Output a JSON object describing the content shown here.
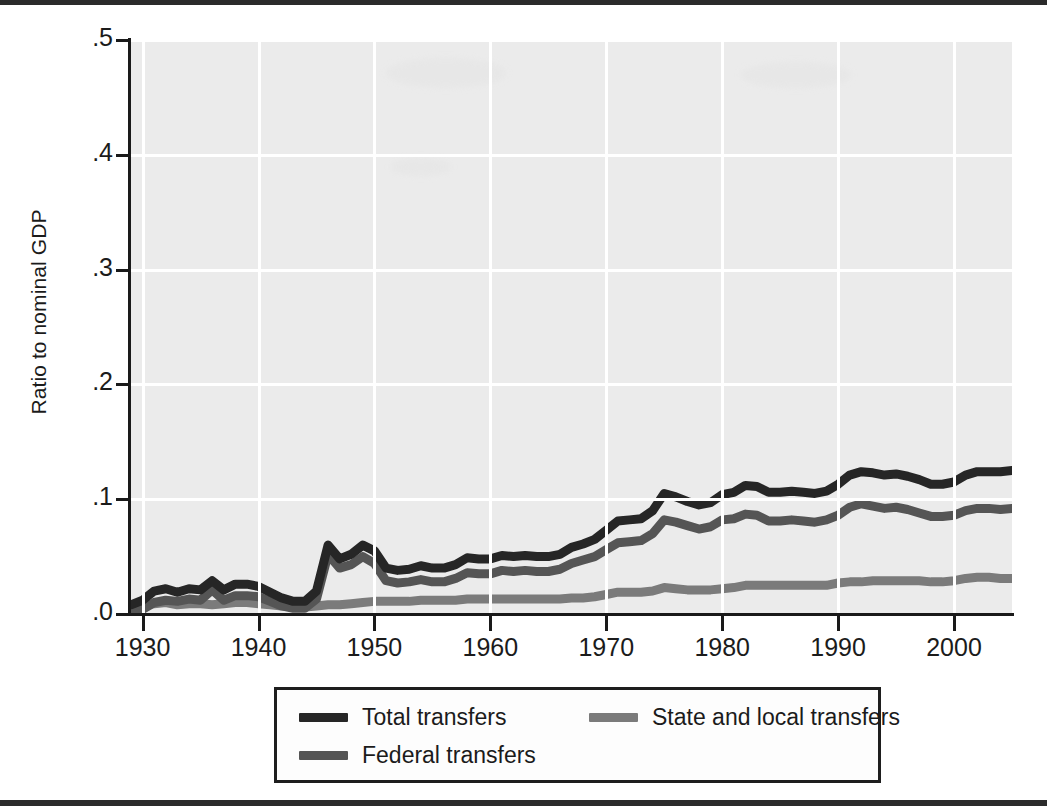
{
  "axes": {
    "ylabel": "Ratio to nominal GDP",
    "y_ticks": [
      ".0",
      ".1",
      ".2",
      ".3",
      ".4",
      ".5"
    ],
    "x_ticks": [
      "1930",
      "1940",
      "1950",
      "1960",
      "1970",
      "1980",
      "1990",
      "2000"
    ]
  },
  "legend": {
    "items": [
      {
        "label": "Total transfers",
        "color": "#262626"
      },
      {
        "label": "State and local transfers",
        "color": "#7b7b7b"
      },
      {
        "label": "Federal transfers",
        "color": "#555555"
      }
    ]
  },
  "colors": {
    "plot_background": "#ebebeb",
    "gridline": "#ffffff",
    "axis": "#1a1a1a",
    "total": "#262626",
    "federal": "#555555",
    "state_local": "#7b7b7b"
  },
  "chart_data": {
    "type": "line",
    "title": "",
    "xlabel": "",
    "ylabel": "Ratio to nominal GDP",
    "xlim": [
      1929,
      2005
    ],
    "ylim": [
      0.0,
      0.5
    ],
    "ytick_values": [
      0.0,
      0.1,
      0.2,
      0.3,
      0.4,
      0.5
    ],
    "xtick_values": [
      1930,
      1940,
      1950,
      1960,
      1970,
      1980,
      1990,
      2000
    ],
    "grid": true,
    "legend_position": "below-axes",
    "x": [
      1929,
      1930,
      1931,
      1932,
      1933,
      1934,
      1935,
      1936,
      1937,
      1938,
      1939,
      1940,
      1941,
      1942,
      1943,
      1944,
      1945,
      1946,
      1947,
      1948,
      1949,
      1950,
      1951,
      1952,
      1953,
      1954,
      1955,
      1956,
      1957,
      1958,
      1959,
      1960,
      1961,
      1962,
      1963,
      1964,
      1965,
      1966,
      1967,
      1968,
      1969,
      1970,
      1971,
      1972,
      1973,
      1974,
      1975,
      1976,
      1977,
      1978,
      1979,
      1980,
      1981,
      1982,
      1983,
      1984,
      1985,
      1986,
      1987,
      1988,
      1989,
      1990,
      1991,
      1992,
      1993,
      1994,
      1995,
      1996,
      1997,
      1998,
      1999,
      2000,
      2001,
      2002,
      2003,
      2004,
      2005
    ],
    "series": [
      {
        "name": "Total transfers",
        "color": "#262626",
        "values": [
          0.008,
          0.012,
          0.02,
          0.022,
          0.019,
          0.022,
          0.021,
          0.029,
          0.021,
          0.026,
          0.026,
          0.024,
          0.019,
          0.014,
          0.011,
          0.011,
          0.02,
          0.06,
          0.048,
          0.052,
          0.06,
          0.055,
          0.04,
          0.038,
          0.039,
          0.042,
          0.04,
          0.04,
          0.043,
          0.049,
          0.048,
          0.048,
          0.051,
          0.05,
          0.051,
          0.05,
          0.05,
          0.052,
          0.058,
          0.061,
          0.065,
          0.073,
          0.081,
          0.082,
          0.083,
          0.09,
          0.105,
          0.102,
          0.098,
          0.095,
          0.097,
          0.104,
          0.106,
          0.112,
          0.111,
          0.106,
          0.106,
          0.107,
          0.106,
          0.105,
          0.107,
          0.113,
          0.121,
          0.124,
          0.123,
          0.121,
          0.122,
          0.12,
          0.117,
          0.113,
          0.113,
          0.115,
          0.121,
          0.124,
          0.124,
          0.124,
          0.125
        ]
      },
      {
        "name": "Federal transfers",
        "color": "#555555",
        "values": [
          0.002,
          0.004,
          0.01,
          0.012,
          0.011,
          0.013,
          0.012,
          0.021,
          0.012,
          0.016,
          0.016,
          0.015,
          0.011,
          0.007,
          0.005,
          0.005,
          0.013,
          0.052,
          0.04,
          0.043,
          0.05,
          0.044,
          0.029,
          0.027,
          0.028,
          0.03,
          0.028,
          0.028,
          0.031,
          0.036,
          0.035,
          0.035,
          0.038,
          0.037,
          0.038,
          0.037,
          0.037,
          0.039,
          0.044,
          0.047,
          0.05,
          0.056,
          0.062,
          0.063,
          0.064,
          0.07,
          0.082,
          0.08,
          0.077,
          0.074,
          0.076,
          0.082,
          0.083,
          0.087,
          0.086,
          0.081,
          0.081,
          0.082,
          0.081,
          0.08,
          0.082,
          0.086,
          0.093,
          0.096,
          0.094,
          0.092,
          0.093,
          0.091,
          0.088,
          0.085,
          0.085,
          0.086,
          0.09,
          0.092,
          0.092,
          0.091,
          0.092
        ]
      },
      {
        "name": "State and local transfers",
        "color": "#7b7b7b",
        "values": [
          0.006,
          0.007,
          0.009,
          0.01,
          0.008,
          0.009,
          0.009,
          0.008,
          0.009,
          0.01,
          0.01,
          0.009,
          0.008,
          0.007,
          0.006,
          0.006,
          0.007,
          0.008,
          0.008,
          0.009,
          0.01,
          0.011,
          0.011,
          0.011,
          0.011,
          0.012,
          0.012,
          0.012,
          0.012,
          0.013,
          0.013,
          0.013,
          0.013,
          0.013,
          0.013,
          0.013,
          0.013,
          0.013,
          0.014,
          0.014,
          0.015,
          0.017,
          0.019,
          0.019,
          0.019,
          0.02,
          0.023,
          0.022,
          0.021,
          0.021,
          0.021,
          0.022,
          0.023,
          0.025,
          0.025,
          0.025,
          0.025,
          0.025,
          0.025,
          0.025,
          0.025,
          0.027,
          0.028,
          0.028,
          0.029,
          0.029,
          0.029,
          0.029,
          0.029,
          0.028,
          0.028,
          0.029,
          0.031,
          0.032,
          0.032,
          0.031,
          0.031
        ]
      }
    ]
  }
}
